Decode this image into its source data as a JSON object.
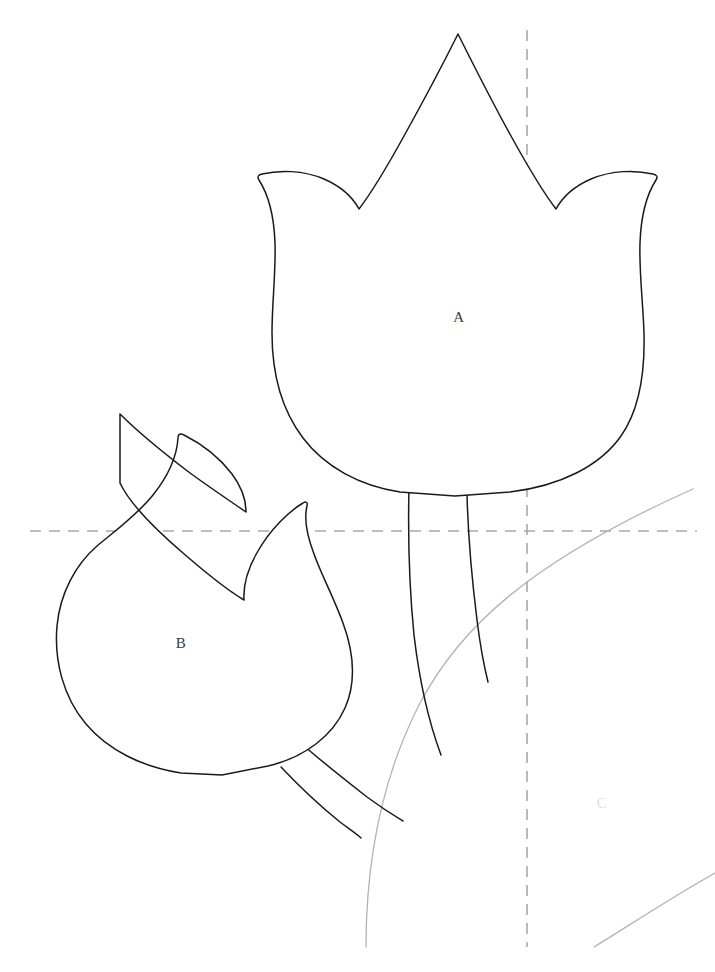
{
  "canvas": {
    "width": 715,
    "height": 972,
    "background": "#ffffff",
    "title": "Tulip applique pattern template"
  },
  "style": {
    "outline_color": "#1a1a1a",
    "outline_width": 1.5,
    "guide_color": "#a8a8a8",
    "guide_arc_color": "#b4b4b4",
    "label_color": "#3a3a3a",
    "faint_label_color": "#dedede",
    "dash_pattern": "11 8"
  },
  "pieces": [
    {
      "id": "piece-a",
      "label": "A",
      "label_x": 459,
      "label_y": 319,
      "faint": false,
      "description": "upright tulip flower head, three petals",
      "path": "M 458 34 C 446 58 424 100 404 136 C 388 165 372 192 359 209 C 352 196 340 186 324 179 C 303 170 279 170 262 174 C 258 175 257 177 259 180 C 268 194 274 215 275 243 C 276 272 272 302 272 333 C 272 372 281 409 303 438 C 325 467 360 486 400 492 L 455 496 L 510 492 C 560 486 600 466 621 436 C 640 409 645 372 644 333 C 643 302 639 272 640 243 C 641 215 647 194 656 180 C 658 177 657 175 653 174 C 636 170 612 170 591 179 C 575 186 563 196 556 209 C 543 192 527 165 511 136 C 491 100 470 58 458 34 Z"
    },
    {
      "id": "piece-b",
      "label": "B",
      "label_x": 181,
      "label_y": 645,
      "faint": false,
      "description": "tulip flower head rotated counter-clockwise, pointing upper-left",
      "path": "M 120 414 C 137 431 165 454 190 473 C 212 489 233 503 246 512 C 246 498 241 486 232 474 C 219 457 200 443 184 435 C 180 433 178 434 178 438 C 177 455 169 475 153 495 C 137 515 115 531 97 546 C 75 565 60 594 57 626 C 54 660 63 697 86 724 C 108 750 142 767 181 773 L 222 775 L 268 766 C 306 757 333 735 345 708 C 356 683 354 653 343 623 C 334 598 321 574 314 554 C 306 533 304 518 307 506 C 308 502 306 501 303 503 C 288 512 270 530 258 551 C 248 568 243 584 244 600 C 229 591 206 573 183 553 C 155 529 129 502 120 483 Z"
    }
  ],
  "stems": [
    {
      "id": "stem-a-left",
      "description": "left edge of tulip A stem",
      "path": "M 409 487 C 408 530 409 585 414 635 C 420 686 431 728 441 755"
    },
    {
      "id": "stem-a-right",
      "description": "right edge of tulip A stem",
      "path": "M 467 494 C 468 534 472 580 477 620 C 481 652 485 670 488 682"
    },
    {
      "id": "stem-b-upper",
      "description": "upper edge of tulip B stem",
      "path": "M 303 745 C 320 760 344 779 367 797 C 386 811 398 818 403 821"
    },
    {
      "id": "stem-b-lower",
      "description": "lower edge of tulip B stem",
      "path": "M 281 767 C 298 785 320 806 340 822 C 352 831 359 836 361 838"
    }
  ],
  "guides": [
    {
      "id": "guide-horizontal",
      "type": "dashed-line",
      "orientation": "horizontal",
      "x1": 30,
      "y1": 531,
      "x2": 697,
      "y2": 531
    },
    {
      "id": "guide-vertical",
      "type": "dashed-line",
      "orientation": "vertical",
      "x1": 527,
      "y1": 30,
      "x2": 527,
      "y2": 947
    }
  ],
  "guide_arcs": [
    {
      "id": "guide-arc-main",
      "description": "large light grey arc sweeping from lower-left to upper-right",
      "path": "M 366 947 C 366 860 383 776 419 705 C 458 630 527 563 693 489"
    },
    {
      "id": "guide-arc-corner",
      "description": "small light grey arc in lower right corner",
      "path": "M 594 947 C 630 925 672 897 715 873"
    }
  ],
  "labels": [
    {
      "id": "label-c",
      "text": "C",
      "x": 602,
      "y": 805,
      "faint": true,
      "description": "faint C region label in lower right"
    }
  ]
}
